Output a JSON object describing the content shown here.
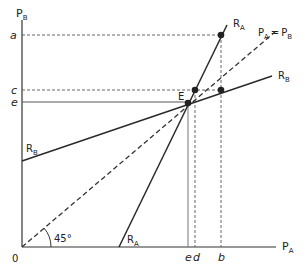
{
  "axes": {
    "y_label": "P",
    "y_label_sub": "B",
    "x_label": "P",
    "x_label_sub": "A",
    "origin": "0"
  },
  "y_ticks": {
    "a": "a",
    "c": "c",
    "e": "e"
  },
  "x_ticks": {
    "e": "e",
    "d": "d",
    "b": "b"
  },
  "curves": {
    "ra_top": "R",
    "ra_top_sub": "A",
    "ra_bottom": "R",
    "ra_bottom_sub": "A",
    "rb_right": "R",
    "rb_right_sub": "B",
    "rb_left": "R",
    "rb_left_sub": "B",
    "diagonal_p1": "P",
    "diagonal_p1_sub": "A",
    "diagonal_eq": "=",
    "diagonal_p2": "P",
    "diagonal_p2_sub": "B"
  },
  "equilibrium_label": "E",
  "angle_label": "45°",
  "colors": {
    "line": "#2a2a2a",
    "dashed": "#444444",
    "guide": "#777777"
  }
}
